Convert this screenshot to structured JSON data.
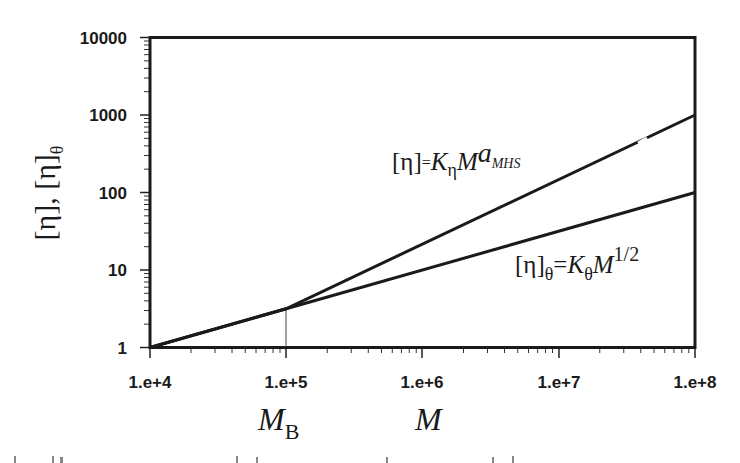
{
  "chart_data": {
    "type": "line",
    "title": "",
    "xlabel": "M",
    "xlabel_marker": "M_B",
    "ylabel": "[η], [η]θ",
    "x_scale": "log",
    "y_scale": "log",
    "xlim": [
      10000,
      100000000
    ],
    "ylim": [
      1,
      10000
    ],
    "x_ticks": [
      10000,
      100000,
      1000000,
      10000000,
      100000000
    ],
    "x_tick_labels": [
      "1.e+4",
      "1.e+5",
      "1.e+6",
      "1.e+7",
      "1.e+8"
    ],
    "y_ticks": [
      1,
      10,
      100,
      1000,
      10000
    ],
    "y_tick_labels": [
      "1",
      "10",
      "100",
      "1000",
      "10000"
    ],
    "grid": false,
    "legend": "none (inline equation annotations)",
    "marker_line": {
      "x": 100000,
      "label": "M_B",
      "y_top": 3.16
    },
    "series": [
      {
        "name": "[η] = K_η M^a_MHS",
        "points": [
          [
            10000,
            1
          ],
          [
            100000,
            3.16
          ],
          [
            100000000,
            1000
          ]
        ],
        "note": "slope 0.5 below M_B, slope ≈0.83 above M_B"
      },
      {
        "name": "[η]_θ = K_θ M^1/2",
        "points": [
          [
            10000,
            1
          ],
          [
            100000,
            3.16
          ],
          [
            100000000,
            100
          ]
        ],
        "note": "slope 0.5 throughout"
      }
    ],
    "annotations": [
      {
        "text": "[η]=K_η M^a_MHS",
        "x": 1000000,
        "y": 150
      },
      {
        "text": "[η]_θ=K_θ M^1/2",
        "x": 15000000,
        "y": 12
      }
    ]
  },
  "labels": {
    "y_axis_main": "[η], [η]",
    "y_axis_sub": "θ",
    "x_axis_mb_main": "M",
    "x_axis_mb_sub": "B",
    "x_axis_m": "M",
    "eq1_bracket": "[η]",
    "eq1_eq": "=",
    "eq1_k": "K",
    "eq1_ksub": "η",
    "eq1_m": "M",
    "eq1_exp": "a",
    "eq1_expsub": "MHS",
    "eq2_bracket": "[η]",
    "eq2_sub": "θ",
    "eq2_eq": "=",
    "eq2_k": "K",
    "eq2_ksub": "θ",
    "eq2_m": "M",
    "eq2_exp": "1/2"
  },
  "ticks": {
    "x": [
      "1.e+4",
      "1.e+5",
      "1.e+6",
      "1.e+7",
      "1.e+8"
    ],
    "y": [
      "1",
      "10",
      "100",
      "1000",
      "10000"
    ]
  }
}
